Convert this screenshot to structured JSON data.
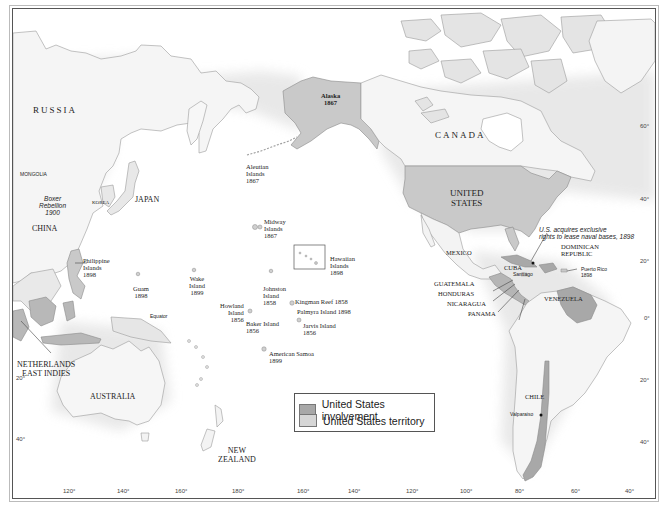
{
  "map": {
    "colors": {
      "ocean": "#ffffff",
      "land": "#f4f4f4",
      "land_edge": "#9a9a9a",
      "us_territory": "#c9c9c9",
      "us_involvement": "#a8a8a8",
      "frame": "#555555"
    },
    "regions": {
      "russia": "RUSSIA",
      "mongolia": "MONGOLIA",
      "china": "CHINA",
      "korea": "KOREA",
      "japan": "JAPAN",
      "australia": "AUSTRALIA",
      "netherlands_east_indies": "NETHERLANDS\nEAST INDIES",
      "new_zealand": "NEW\nZEALAND",
      "canada": "CANADA",
      "united_states": "UNITED\nSTATES",
      "mexico": "MEXICO",
      "cuba": "CUBA",
      "dominican_republic": "DOMINICAN\nREPUBLIC",
      "guatemala": "GUATEMALA",
      "honduras": "HONDURAS",
      "nicaragua": "NICARAGUA",
      "panama": "PANAMA",
      "venezuela": "VENEZUELA",
      "chile": "CHILE"
    },
    "territories": [
      {
        "name": "Alaska",
        "year": "1867"
      },
      {
        "name": "Aleutian Islands",
        "year": "1867"
      },
      {
        "name": "Midway Islands",
        "year": "1867"
      },
      {
        "name": "Hawaiian Islands",
        "year": "1898"
      },
      {
        "name": "Philippine Islands",
        "year": "1898"
      },
      {
        "name": "Guam",
        "year": "1898"
      },
      {
        "name": "Wake Island",
        "year": "1899"
      },
      {
        "name": "Johnston Island",
        "year": "1858"
      },
      {
        "name": "Howland Island",
        "year": "1856"
      },
      {
        "name": "Baker Island",
        "year": "1856"
      },
      {
        "name": "Kingman Reef",
        "year": "1858"
      },
      {
        "name": "Palmyra Island",
        "year": "1898"
      },
      {
        "name": "Jarvis Island",
        "year": "1856"
      },
      {
        "name": "American Samoa",
        "year": "1899"
      },
      {
        "name": "Puerto Rico",
        "year": "1898"
      }
    ],
    "labels": {
      "alaska": "Alaska\n1867",
      "aleutian": "Aleutian\nIslands\n1867",
      "midway": "Midway\nIslands\n1867",
      "hawaiian": "Hawaiian\nIslands\n1898",
      "philippine": "Philippine\nIslands\n1898",
      "guam": "Guam\n1898",
      "wake": "Wake\nIsland\n1899",
      "johnston": "Johnston\nIsland\n1858",
      "howland": "Howland\nIsland\n1856",
      "baker": "Baker Island\n1856",
      "kingman": "Kingman Reef 1858",
      "palmyra": "Palmyra Island 1898",
      "jarvis": "Jarvis Island\n1856",
      "samoa": "American Samoa\n1899",
      "puerto_rico": "Puerto Rico\n1898",
      "boxer": "Boxer\nRebellion\n1900",
      "naval_bases": "U.S. acquires exclusive\nrights to lease naval bases, 1898",
      "santiago": "Santiago",
      "valparaiso": "Valparaiso",
      "equator": "Equator"
    },
    "latitude_ticks_right": [
      "60°",
      "40°",
      "20°",
      "0°",
      "20°",
      "40°"
    ],
    "latitude_ticks_left": [
      "20°",
      "40°"
    ],
    "longitude_ticks": [
      "120°",
      "140°",
      "160°",
      "180°",
      "160°",
      "140°",
      "120°",
      "100°",
      "80°",
      "60°",
      "40°"
    ]
  },
  "legend": {
    "items": [
      {
        "label": "United States involvement",
        "color": "#a8a8a8"
      },
      {
        "label": "United States territory",
        "color": "#d6d6d6"
      }
    ]
  }
}
